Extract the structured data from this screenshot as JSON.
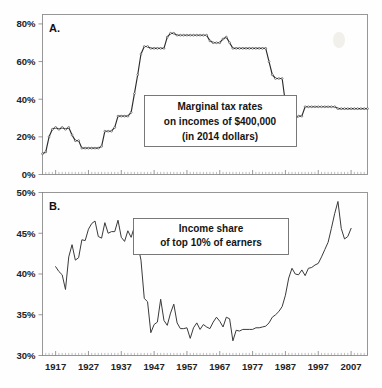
{
  "figure": {
    "title": "",
    "background_color": "#fefefe",
    "line_color": "#2b2b2b",
    "frame_color": "#8d8d8d"
  },
  "panel_a": {
    "letter": "A.",
    "callout_lines": [
      "Marginal tax rates",
      "on incomes of $400,000",
      "(in 2014 dollars)"
    ]
  },
  "panel_b": {
    "letter": "B.",
    "callout_lines": [
      "Income share",
      "of top 10% of earners"
    ]
  },
  "chart_data": [
    {
      "type": "line",
      "panel": "A",
      "title": "Marginal tax rates on incomes of $400,000 (in 2014 dollars)",
      "xlabel": "",
      "ylabel": "",
      "xlim": [
        1913,
        2012
      ],
      "ylim": [
        0,
        85
      ],
      "yticks": [
        0,
        20,
        40,
        60,
        80
      ],
      "ytick_labels": [
        "0%",
        "20%",
        "40%",
        "60%",
        "80%"
      ],
      "xticks": [
        1917,
        1927,
        1937,
        1947,
        1957,
        1967,
        1977,
        1987,
        1997,
        2007
      ],
      "xtick_labels": [
        "1917",
        "1927",
        "1937",
        "1947",
        "1957",
        "1967",
        "1977",
        "1987",
        "1997",
        "2007"
      ],
      "grid": false,
      "legend": "none",
      "markers": "open-circle",
      "x": [
        1913,
        1914,
        1915,
        1916,
        1917,
        1918,
        1919,
        1920,
        1921,
        1922,
        1923,
        1924,
        1925,
        1926,
        1927,
        1928,
        1929,
        1930,
        1931,
        1932,
        1933,
        1934,
        1935,
        1936,
        1937,
        1938,
        1939,
        1940,
        1941,
        1942,
        1943,
        1944,
        1945,
        1946,
        1947,
        1948,
        1949,
        1950,
        1951,
        1952,
        1953,
        1954,
        1955,
        1956,
        1957,
        1958,
        1959,
        1960,
        1961,
        1962,
        1963,
        1964,
        1965,
        1966,
        1967,
        1968,
        1969,
        1970,
        1971,
        1972,
        1973,
        1974,
        1975,
        1976,
        1977,
        1978,
        1979,
        1980,
        1981,
        1982,
        1983,
        1984,
        1985,
        1986,
        1987,
        1988,
        1989,
        1990,
        1991,
        1992,
        1993,
        1994,
        1995,
        1996,
        1997,
        1998,
        1999,
        2000,
        2001,
        2002,
        2003,
        2004,
        2005,
        2006,
        2007,
        2008,
        2009,
        2010,
        2011,
        2012
      ],
      "values": [
        11,
        12,
        20,
        24,
        25,
        24,
        25,
        24,
        25,
        21,
        18,
        18,
        14,
        14,
        14,
        14,
        14,
        14,
        15,
        23,
        23,
        23,
        25,
        31,
        31,
        31,
        31,
        33,
        43,
        53,
        64,
        68,
        68,
        67,
        67,
        67,
        67,
        67,
        73,
        75,
        75,
        74,
        74,
        74,
        74,
        74,
        74,
        74,
        74,
        74,
        74,
        71,
        70,
        70,
        70,
        72,
        73,
        70,
        67,
        67,
        67,
        67,
        67,
        67,
        67,
        67,
        67,
        67,
        67,
        60,
        53,
        51,
        51,
        51,
        38,
        33,
        30,
        30,
        31,
        31,
        36,
        36,
        36,
        36,
        36,
        36,
        36,
        36,
        36,
        36,
        35,
        35,
        35,
        35,
        35,
        35,
        35,
        35,
        35,
        35
      ]
    },
    {
      "type": "line",
      "panel": "B",
      "title": "Income share of top 10% of earners",
      "xlabel": "",
      "ylabel": "",
      "xlim": [
        1913,
        2012
      ],
      "ylim": [
        30,
        50
      ],
      "yticks": [
        30,
        35,
        40,
        45,
        50
      ],
      "ytick_labels": [
        "30%",
        "35%",
        "40%",
        "45%",
        "50%"
      ],
      "xticks": [
        1917,
        1927,
        1937,
        1947,
        1957,
        1967,
        1977,
        1987,
        1997,
        2007
      ],
      "xtick_labels": [
        "1917",
        "1927",
        "1937",
        "1947",
        "1957",
        "1967",
        "1977",
        "1987",
        "1997",
        "2007"
      ],
      "grid": false,
      "legend": "none",
      "markers": "none",
      "x": [
        1917,
        1918,
        1919,
        1920,
        1921,
        1922,
        1923,
        1924,
        1925,
        1926,
        1927,
        1928,
        1929,
        1930,
        1931,
        1932,
        1933,
        1934,
        1935,
        1936,
        1937,
        1938,
        1939,
        1940,
        1941,
        1942,
        1943,
        1944,
        1945,
        1946,
        1947,
        1948,
        1949,
        1950,
        1951,
        1952,
        1953,
        1954,
        1955,
        1956,
        1957,
        1958,
        1959,
        1960,
        1961,
        1962,
        1963,
        1964,
        1965,
        1966,
        1967,
        1968,
        1969,
        1970,
        1971,
        1972,
        1973,
        1974,
        1975,
        1976,
        1977,
        1978,
        1979,
        1980,
        1981,
        1982,
        1983,
        1984,
        1985,
        1986,
        1987,
        1988,
        1989,
        1990,
        1991,
        1992,
        1993,
        1994,
        1995,
        1996,
        1997,
        1998,
        1999,
        2000,
        2001,
        2002,
        2003,
        2004,
        2005,
        2006,
        2007
      ],
      "values": [
        40.9,
        40.3,
        39.9,
        38.1,
        42.1,
        43.6,
        41.7,
        42.0,
        44.2,
        44.1,
        45.5,
        46.2,
        46.5,
        44.6,
        44.4,
        46.3,
        45.0,
        45.2,
        45.2,
        46.6,
        44.5,
        44.0,
        45.3,
        44.5,
        45.8,
        43.7,
        41.7,
        37.0,
        36.6,
        32.8,
        33.8,
        34.1,
        36.9,
        34.3,
        33.7,
        35.2,
        36.3,
        34.0,
        33.3,
        33.3,
        33.4,
        32.1,
        33.4,
        34.0,
        33.2,
        33.8,
        33.5,
        33.3,
        34.1,
        34.7,
        34.2,
        33.5,
        34.7,
        34.5,
        31.8,
        33.1,
        33.0,
        33.2,
        33.2,
        33.2,
        33.2,
        33.4,
        33.4,
        33.5,
        33.6,
        34.0,
        34.7,
        35.0,
        35.4,
        36.0,
        37.4,
        39.5,
        40.7,
        40.0,
        39.9,
        40.5,
        39.8,
        40.7,
        40.8,
        41.1,
        41.3,
        42.1,
        43.0,
        43.9,
        45.6,
        47.4,
        48.9,
        45.6,
        44.3,
        44.6,
        45.6,
        47.5,
        49.7
      ]
    }
  ]
}
